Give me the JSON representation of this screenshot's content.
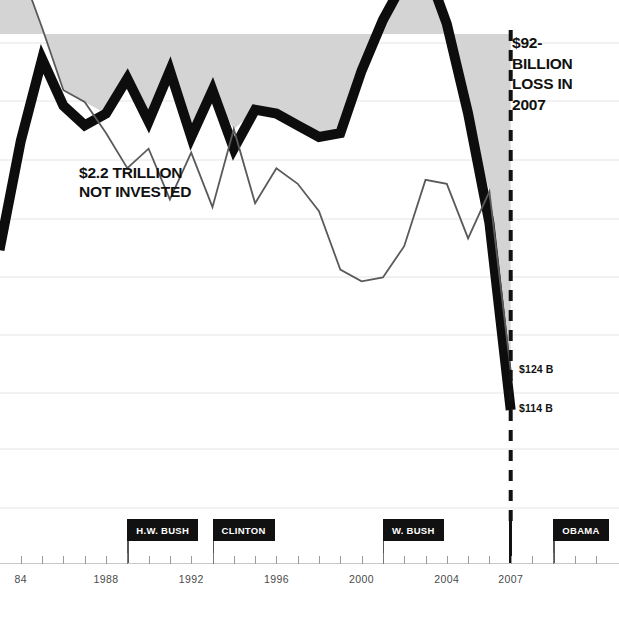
{
  "chart_data": {
    "type": "line",
    "title": "",
    "xlabel": "",
    "ylabel": "",
    "xlim": [
      1983,
      2011
    ],
    "grid": true,
    "legend": "none",
    "annotations": [
      {
        "name": "gap-callout",
        "text": "$2.2 TRILLION\nNOT INVESTED"
      },
      {
        "name": "loss-callout",
        "text": "$92-\nBILLION\nLOSS IN\n2007"
      }
    ],
    "end_labels": [
      {
        "series": "thin-line",
        "text": "$124 B",
        "value": 124
      },
      {
        "series": "thick-line",
        "text": "$114 B",
        "value": 114
      }
    ],
    "x_ticks": [
      {
        "year": 1984,
        "label": "84",
        "major": false
      },
      {
        "year": 1985,
        "label": "",
        "major": false
      },
      {
        "year": 1986,
        "label": "",
        "major": false
      },
      {
        "year": 1987,
        "label": "",
        "major": false
      },
      {
        "year": 1988,
        "label": "1988",
        "major": false
      },
      {
        "year": 1989,
        "label": "",
        "major": true
      },
      {
        "year": 1990,
        "label": "",
        "major": false
      },
      {
        "year": 1991,
        "label": "",
        "major": false
      },
      {
        "year": 1992,
        "label": "1992",
        "major": false
      },
      {
        "year": 1993,
        "label": "",
        "major": true
      },
      {
        "year": 1994,
        "label": "",
        "major": false
      },
      {
        "year": 1995,
        "label": "",
        "major": false
      },
      {
        "year": 1996,
        "label": "1996",
        "major": false
      },
      {
        "year": 1997,
        "label": "",
        "major": false
      },
      {
        "year": 1998,
        "label": "",
        "major": false
      },
      {
        "year": 1999,
        "label": "",
        "major": false
      },
      {
        "year": 2000,
        "label": "2000",
        "major": false
      },
      {
        "year": 2001,
        "label": "",
        "major": true
      },
      {
        "year": 2002,
        "label": "",
        "major": false
      },
      {
        "year": 2003,
        "label": "",
        "major": false
      },
      {
        "year": 2004,
        "label": "2004",
        "major": false
      },
      {
        "year": 2005,
        "label": "",
        "major": false
      },
      {
        "year": 2006,
        "label": "",
        "major": false
      },
      {
        "year": 2007,
        "label": "2007",
        "major": false
      },
      {
        "year": 2008,
        "label": "",
        "major": false
      },
      {
        "year": 2009,
        "label": "",
        "major": true
      },
      {
        "year": 2010,
        "label": "",
        "major": false
      },
      {
        "year": 2011,
        "label": "",
        "major": false
      }
    ],
    "presidents": [
      {
        "name": "H.W. BUSH",
        "label": "H.W. BUSH",
        "start_year": 1989
      },
      {
        "name": "CLINTON",
        "label": "CLINTON",
        "start_year": 1993
      },
      {
        "name": "W. BUSH",
        "label": "W. BUSH",
        "start_year": 2001
      },
      {
        "name": "OBAMA",
        "label": "OBAMA",
        "start_year": 2009
      }
    ],
    "divider": {
      "year": 2007,
      "style": "dashed-black",
      "label": "2007"
    },
    "series": [
      {
        "name": "thick-line",
        "style": "thick-black",
        "x": [
          1983,
          1984,
          1985,
          1986,
          1987,
          1988,
          1989,
          1990,
          1991,
          1992,
          1993,
          1994,
          1995,
          1996,
          1997,
          1998,
          1999,
          2000,
          2001,
          2002,
          2003,
          2004,
          2005,
          2006,
          2007
        ],
        "values": [
          155,
          183,
          204,
          192,
          187,
          190,
          199,
          188,
          201,
          184,
          196,
          181,
          191,
          190,
          187,
          184,
          185,
          201,
          214,
          224,
          228,
          213,
          190,
          162,
          114
        ]
      },
      {
        "name": "thin-line",
        "style": "thin-gray",
        "x": [
          1983,
          1984,
          1985,
          1986,
          1987,
          1988,
          1989,
          1990,
          1991,
          1992,
          1993,
          1994,
          1995,
          1996,
          1997,
          1998,
          1999,
          2000,
          2001,
          2002,
          2003,
          2004,
          2005,
          2006,
          2007
        ],
        "values": [
          233,
          227,
          212,
          196,
          193,
          185,
          176,
          181,
          168,
          180,
          166,
          186,
          167,
          176,
          172,
          165,
          150,
          147,
          148,
          156,
          173,
          172,
          158,
          170,
          124
        ]
      }
    ],
    "y_gridlines": [
      43,
      101,
      160,
      219,
      277,
      335,
      393,
      449,
      508
    ]
  },
  "colors": {
    "shaded_gap": "#d4d4d4",
    "thick_line": "#0d0d0d",
    "thin_line": "#5a5a5a",
    "grid": "#e4e4e4",
    "marker_bg": "#111111",
    "marker_text": "#ffffff",
    "axis": "#c8c8c8",
    "tick": "#9a9a9a",
    "year_text": "#4a4a4a",
    "annotation_text": "#111111",
    "background": "#ffffff"
  }
}
